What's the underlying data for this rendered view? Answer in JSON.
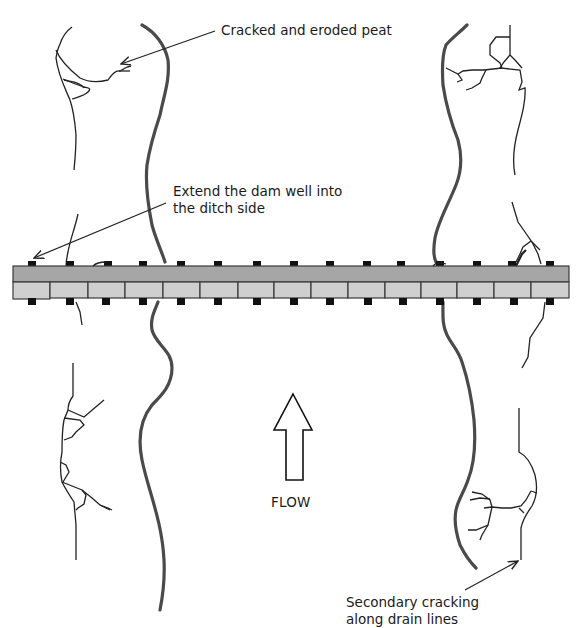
{
  "diagram": {
    "type": "plan-view schematic",
    "annotations": {
      "top_right": "Cracked and eroded peat",
      "middle_left_line1": "Extend the dam well into",
      "middle_left_line2": "the ditch side",
      "bottom_right_line1": "Secondary cracking",
      "bottom_right_line2": "along drain lines"
    },
    "flow": {
      "label": "FLOW",
      "direction": "up"
    },
    "dam": {
      "upper_board_color": "#a6a6a6",
      "lower_board_color": "#cfcfcf",
      "outline_color": "#3a3a3a",
      "post_color": "#111111",
      "lower_board_segments": 15,
      "posts_per_side": 15
    },
    "colors": {
      "ditch_edge": "#4a4a4a",
      "crack_line": "#222222",
      "arrow_line": "#222222",
      "background": "#ffffff"
    }
  }
}
